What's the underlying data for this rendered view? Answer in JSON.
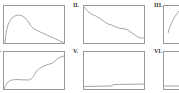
{
  "figure": {
    "panels": [
      {
        "id": "I",
        "label": "",
        "shape": "rise-then-decay"
      },
      {
        "id": "II",
        "label": "II.",
        "shape": "stepwise-decrease"
      },
      {
        "id": "III",
        "label": "III.",
        "shape": "steep-rise"
      },
      {
        "id": "IV",
        "label": ".",
        "shape": "stepwise-increase"
      },
      {
        "id": "V",
        "label": "V.",
        "shape": "flat-with-small-step"
      },
      {
        "id": "VI",
        "label": "VI.",
        "shape": "flat-with-small-rise"
      }
    ],
    "colors": {
      "frame": "#9a9a9a",
      "curve": "#9a9a9a",
      "label": "#333333",
      "background": "#ffffff"
    }
  }
}
